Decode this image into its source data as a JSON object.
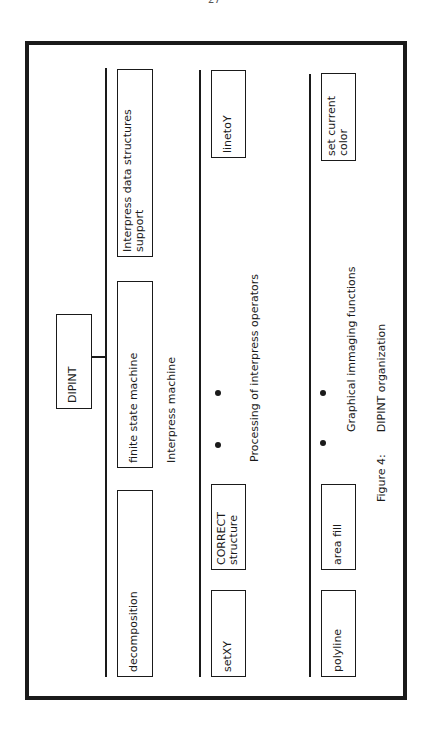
{
  "page": {
    "number": "27"
  },
  "diagram": {
    "root": {
      "label": "DIPINT"
    },
    "groups": [
      {
        "label": "Interpress machine",
        "boxes": [
          {
            "label_line1": "Interpress data structures",
            "label_line2": "support"
          },
          {
            "label_line1": "finite state machine",
            "label_line2": ""
          },
          {
            "label_line1": "decomposition",
            "label_line2": ""
          }
        ]
      },
      {
        "label": "Processing of interpress operators",
        "boxes": [
          {
            "label_line1": "linetoY",
            "label_line2": ""
          },
          {
            "label_line1": "CORRECT",
            "label_line2": "structure"
          },
          {
            "label_line1": "setXY",
            "label_line2": ""
          }
        ],
        "ellipsis": "• •"
      },
      {
        "label": "Graphical immaging functions",
        "boxes": [
          {
            "label_line1": "set current",
            "label_line2": "color"
          },
          {
            "label_line1": "area fill",
            "label_line2": ""
          },
          {
            "label_line1": "polyline",
            "label_line2": ""
          }
        ],
        "ellipsis": "• •"
      }
    ],
    "caption": {
      "figure": "Figure 4:",
      "title": "DIPINT organization"
    }
  }
}
